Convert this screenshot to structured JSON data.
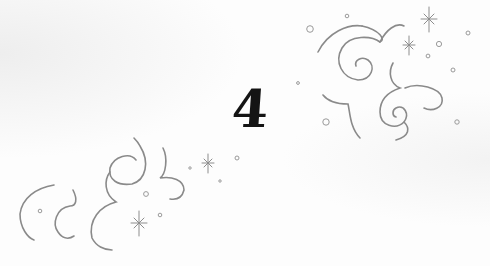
{
  "page": {
    "numeral": "4",
    "colors": {
      "background": "#fefefe",
      "ornament_stroke": "#8a8a8a",
      "numeral": "#141414"
    }
  },
  "ornaments": {
    "upper_right": {
      "name": "swirl-cluster-upper-right",
      "sparkles": 2,
      "bubbles": 9
    },
    "lower_left": {
      "name": "swirl-cluster-lower-left",
      "sparkles": 2,
      "bubbles": 6
    }
  }
}
